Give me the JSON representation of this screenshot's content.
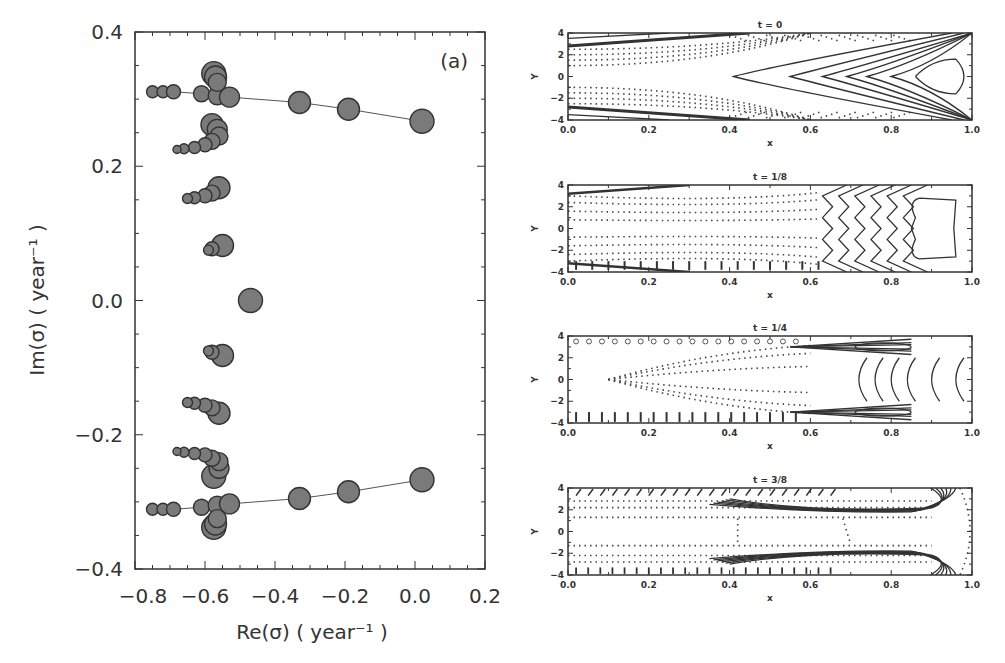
{
  "chart_data": [
    {
      "type": "scatter",
      "title": "",
      "annotation": "(a)",
      "xlabel": "Re(σ)  ( year⁻¹ )",
      "ylabel": "Im(σ)  ( year⁻¹ )",
      "xlim": [
        -0.8,
        0.2
      ],
      "ylim": [
        -0.4,
        0.4
      ],
      "xticks": [
        "-0.8",
        "-0.6",
        "-0.4",
        "-0.2",
        "0.0",
        "0.2"
      ],
      "yticks": [
        "0.4",
        "0.2",
        "0.0",
        "-0.2",
        "-0.4"
      ],
      "grid": false,
      "marker_color": "#7a7a7a",
      "series": [
        {
          "name": "upper branch (connected)",
          "line": true,
          "points": [
            [
              -0.75,
              0.311,
              6
            ],
            [
              -0.72,
              0.311,
              6
            ],
            [
              -0.69,
              0.311,
              7
            ],
            [
              -0.61,
              0.308,
              8
            ],
            [
              -0.565,
              0.305,
              9
            ],
            [
              -0.53,
              0.303,
              10
            ],
            [
              -0.33,
              0.295,
              11
            ],
            [
              -0.19,
              0.285,
              11
            ],
            [
              0.02,
              0.267,
              12
            ]
          ]
        },
        {
          "name": "lower branch (connected)",
          "line": true,
          "points": [
            [
              -0.75,
              -0.311,
              6
            ],
            [
              -0.72,
              -0.311,
              6
            ],
            [
              -0.69,
              -0.311,
              7
            ],
            [
              -0.61,
              -0.308,
              8
            ],
            [
              -0.565,
              -0.305,
              9
            ],
            [
              -0.53,
              -0.303,
              10
            ],
            [
              -0.33,
              -0.295,
              11
            ],
            [
              -0.19,
              -0.285,
              11
            ],
            [
              0.02,
              -0.267,
              12
            ]
          ]
        },
        {
          "name": "clusters",
          "line": false,
          "points": [
            [
              -0.575,
              0.338,
              12
            ],
            [
              -0.57,
              0.333,
              11
            ],
            [
              -0.565,
              0.325,
              9
            ],
            [
              -0.58,
              0.262,
              11
            ],
            [
              -0.565,
              0.255,
              10
            ],
            [
              -0.56,
              0.245,
              9
            ],
            [
              -0.58,
              0.237,
              8
            ],
            [
              -0.6,
              0.232,
              7
            ],
            [
              -0.63,
              0.228,
              6
            ],
            [
              -0.66,
              0.226,
              5
            ],
            [
              -0.68,
              0.225,
              4
            ],
            [
              -0.56,
              0.168,
              11
            ],
            [
              -0.58,
              0.16,
              8
            ],
            [
              -0.6,
              0.156,
              7
            ],
            [
              -0.63,
              0.153,
              6
            ],
            [
              -0.65,
              0.152,
              5
            ],
            [
              -0.55,
              0.082,
              11
            ],
            [
              -0.58,
              0.077,
              7
            ],
            [
              -0.59,
              0.075,
              5
            ],
            [
              -0.47,
              0.0,
              12
            ],
            [
              -0.55,
              -0.082,
              11
            ],
            [
              -0.58,
              -0.077,
              7
            ],
            [
              -0.59,
              -0.075,
              5
            ],
            [
              -0.56,
              -0.168,
              11
            ],
            [
              -0.58,
              -0.16,
              8
            ],
            [
              -0.6,
              -0.156,
              7
            ],
            [
              -0.63,
              -0.153,
              6
            ],
            [
              -0.65,
              -0.152,
              5
            ],
            [
              -0.575,
              -0.262,
              12
            ],
            [
              -0.56,
              -0.25,
              10
            ],
            [
              -0.56,
              -0.24,
              9
            ],
            [
              -0.58,
              -0.235,
              8
            ],
            [
              -0.6,
              -0.23,
              7
            ],
            [
              -0.63,
              -0.228,
              6
            ],
            [
              -0.66,
              -0.226,
              5
            ],
            [
              -0.68,
              -0.225,
              4
            ],
            [
              -0.575,
              -0.338,
              12
            ],
            [
              -0.57,
              -0.333,
              11
            ],
            [
              -0.565,
              -0.325,
              9
            ]
          ]
        }
      ]
    },
    {
      "type": "contour",
      "panels": [
        {
          "title": "t = 0"
        },
        {
          "title": "t = 1/8"
        },
        {
          "title": "t = 1/4"
        },
        {
          "title": "t = 3/8"
        }
      ],
      "xlabel": "x",
      "ylabel": "Y",
      "xlim": [
        0.0,
        1.0
      ],
      "ylim": [
        -4,
        4
      ],
      "xticks": [
        "0.0",
        "0.2",
        "0.4",
        "0.6",
        "0.8",
        "1.0"
      ],
      "yticks": [
        "4",
        "2",
        "0",
        "-2",
        "-4"
      ],
      "legend": "solid = positive contours, dotted = negative contours"
    }
  ]
}
